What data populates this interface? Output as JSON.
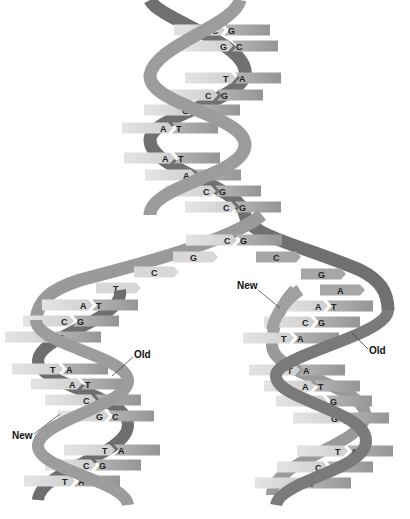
{
  "colors": {
    "strand_dark": "#6e6e6e",
    "strand_mid": "#9a9a9a",
    "rung_light": "#d6d6d6",
    "rung_dark": "#a8a8a8",
    "text": "#222222",
    "background": "#ffffff"
  },
  "labels": {
    "new_left": "New",
    "old_left": "Old",
    "new_right": "New",
    "old_right": "Old"
  },
  "parent_helix": {
    "pairs": [
      {
        "l": "C",
        "r": "G",
        "x": 222,
        "y": 30
      },
      {
        "l": "G",
        "r": "C",
        "x": 230,
        "y": 46
      },
      {
        "l": "T",
        "r": "A",
        "x": 233,
        "y": 78
      },
      {
        "l": "C",
        "r": "G",
        "x": 215,
        "y": 95
      },
      {
        "l": "G",
        "r": "C",
        "x": 192,
        "y": 110
      },
      {
        "l": "A",
        "r": "T",
        "x": 170,
        "y": 128
      },
      {
        "l": "A",
        "r": "T",
        "x": 172,
        "y": 158
      },
      {
        "l": "A",
        "r": "T",
        "x": 193,
        "y": 175
      },
      {
        "l": "C",
        "r": "G",
        "x": 213,
        "y": 191
      },
      {
        "l": "C",
        "r": "G",
        "x": 233,
        "y": 207
      }
    ]
  },
  "fork": {
    "bases": [
      {
        "l": "C",
        "r": "G",
        "x": 234,
        "y": 240
      },
      {
        "b": "G",
        "x": 193,
        "y": 257
      },
      {
        "b": "C",
        "x": 276,
        "y": 257
      },
      {
        "b": "C",
        "x": 154,
        "y": 272
      },
      {
        "b": "G",
        "x": 321,
        "y": 274
      },
      {
        "b": "T",
        "x": 116,
        "y": 288
      },
      {
        "b": "A",
        "x": 340,
        "y": 290
      }
    ]
  },
  "left_daughter": {
    "pairs": [
      {
        "l": "A",
        "r": "T",
        "x": 90,
        "y": 305
      },
      {
        "l": "C",
        "r": "G",
        "x": 71,
        "y": 321
      },
      {
        "l": "T",
        "r": "A",
        "x": 53,
        "y": 337
      },
      {
        "l": "T",
        "r": "A",
        "x": 60,
        "y": 369
      },
      {
        "l": "A",
        "r": "T",
        "x": 79,
        "y": 384
      },
      {
        "l": "C",
        "r": "G",
        "x": 93,
        "y": 400
      },
      {
        "l": "G",
        "r": "C",
        "x": 106,
        "y": 416
      },
      {
        "l": "T",
        "r": "A",
        "x": 112,
        "y": 450
      },
      {
        "l": "C",
        "r": "G",
        "x": 93,
        "y": 465
      },
      {
        "l": "T",
        "r": "A",
        "x": 72,
        "y": 481
      }
    ]
  },
  "right_daughter": {
    "pairs": [
      {
        "l": "A",
        "r": "T",
        "x": 325,
        "y": 306
      },
      {
        "l": "C",
        "r": "G",
        "x": 312,
        "y": 322
      },
      {
        "l": "T",
        "r": "A",
        "x": 291,
        "y": 338
      },
      {
        "l": "T",
        "r": "A",
        "x": 297,
        "y": 370
      },
      {
        "l": "A",
        "r": "T",
        "x": 312,
        "y": 386
      },
      {
        "l": "C",
        "r": "G",
        "x": 324,
        "y": 401
      },
      {
        "l": "G",
        "r": "C",
        "x": 341,
        "y": 418
      },
      {
        "l": "T",
        "r": "A",
        "x": 345,
        "y": 451
      },
      {
        "l": "C",
        "r": "G",
        "x": 325,
        "y": 467
      },
      {
        "l": "A",
        "r": "T",
        "x": 303,
        "y": 483
      }
    ]
  }
}
